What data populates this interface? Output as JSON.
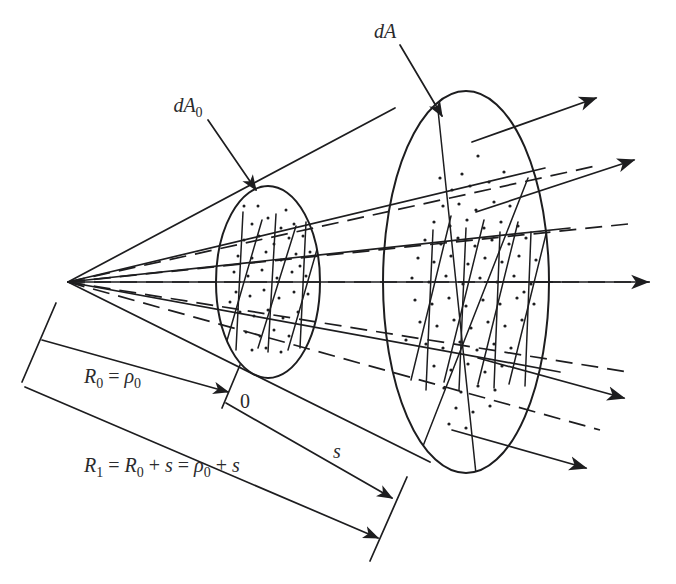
{
  "figure": {
    "background_color": "#ffffff",
    "ink_color": "#1d1d1f",
    "width": 676,
    "height": 584
  },
  "labels": {
    "dA0": {
      "base": "dA",
      "subscript": "0",
      "name": "near-area-element-label"
    },
    "dA": {
      "base": "dA",
      "subscript": "",
      "name": "far-area-element-label"
    },
    "origin_marker": {
      "text": "0",
      "name": "origin-tick-label"
    },
    "s_label": {
      "text": "s",
      "name": "path-length-label"
    },
    "R0": {
      "parts": [
        {
          "text": "R",
          "style": "italic"
        },
        {
          "text": "0",
          "style": "sub"
        },
        {
          "text": " = ",
          "style": "plain"
        },
        {
          "text": "ρ",
          "style": "italic"
        },
        {
          "text": "0",
          "style": "sub"
        }
      ],
      "plain": "R0 = ρ0",
      "name": "near-distance-label"
    },
    "R1": {
      "parts": [
        {
          "text": "R",
          "style": "italic"
        },
        {
          "text": "1",
          "style": "sub"
        },
        {
          "text": " = ",
          "style": "plain"
        },
        {
          "text": "R",
          "style": "italic"
        },
        {
          "text": "0",
          "style": "sub"
        },
        {
          "text": " + ",
          "style": "plain"
        },
        {
          "text": "s",
          "style": "italic"
        },
        {
          "text": " = ",
          "style": "plain"
        },
        {
          "text": "ρ",
          "style": "italic"
        },
        {
          "text": "0",
          "style": "sub"
        },
        {
          "text": " + ",
          "style": "plain"
        },
        {
          "text": "s",
          "style": "italic"
        }
      ],
      "plain": "R1 = R0 + s = ρ0 + s",
      "name": "far-distance-label"
    }
  },
  "geometry": {
    "apex": {
      "x": 68,
      "y": 282,
      "name": "cone-apex"
    },
    "near_ellipse": {
      "cx": 268,
      "cy": 282,
      "rx": 52,
      "ry": 96,
      "name": "near-area-element-ellipse"
    },
    "far_ellipse": {
      "cx": 466,
      "cy": 282,
      "rx": 83,
      "ry": 191,
      "name": "far-area-element-ellipse"
    },
    "ray_count": 5,
    "arrow_count": 5,
    "dimension_lines": [
      {
        "id": "R0",
        "label": "R0 = ρ0"
      },
      {
        "id": "R1",
        "label": "R1 = R0 + s = ρ0 + s"
      },
      {
        "id": "s",
        "label": "s"
      }
    ]
  }
}
